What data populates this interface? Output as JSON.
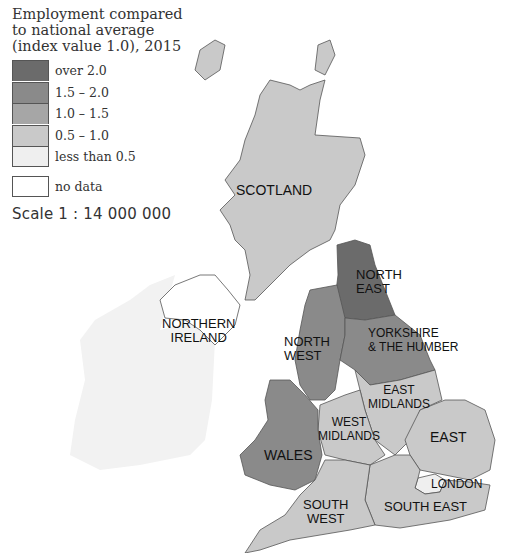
{
  "legend": {
    "title_lines": [
      "Employment compared",
      "to national average",
      "(index value 1.0), 2015"
    ],
    "items": [
      {
        "label": "over 2.0",
        "color": "#6b6b6b"
      },
      {
        "label": "1.5 – 2.0",
        "color": "#8a8a8a"
      },
      {
        "label": "1.0 – 1.5",
        "color": "#a6a6a6"
      },
      {
        "label": "0.5 – 1.0",
        "color": "#c9c9c9"
      },
      {
        "label": "less than 0.5",
        "color": "#efefef"
      }
    ],
    "no_data": {
      "label": "no data",
      "color": "#ffffff"
    },
    "scale": "Scale 1 : 14 000 000"
  },
  "regions": [
    {
      "name": "SCOTLAND",
      "lines": [
        "SCOTLAND"
      ],
      "class": "0.5 – 1.0"
    },
    {
      "name": "NORTH EAST",
      "lines": [
        "NORTH",
        "EAST"
      ],
      "class": "over 2.0"
    },
    {
      "name": "NORTH WEST",
      "lines": [
        "NORTH",
        "WEST"
      ],
      "class": "1.5 – 2.0"
    },
    {
      "name": "YORKSHIRE & THE HUMBER",
      "lines": [
        "YORKSHIRE",
        "& THE HUMBER"
      ],
      "class": "1.5 – 2.0"
    },
    {
      "name": "EAST MIDLANDS",
      "lines": [
        "EAST",
        "MIDLANDS"
      ],
      "class": "0.5 – 1.0"
    },
    {
      "name": "WEST MIDLANDS",
      "lines": [
        "WEST",
        "MIDLANDS"
      ],
      "class": "0.5 – 1.0"
    },
    {
      "name": "WALES",
      "lines": [
        "WALES"
      ],
      "class": "1.5 – 2.0"
    },
    {
      "name": "EAST",
      "lines": [
        "EAST"
      ],
      "class": "0.5 – 1.0"
    },
    {
      "name": "LONDON",
      "lines": [
        "LONDON"
      ],
      "class": "less than 0.5"
    },
    {
      "name": "SOUTH EAST",
      "lines": [
        "SOUTH EAST"
      ],
      "class": "0.5 – 1.0"
    },
    {
      "name": "SOUTH WEST",
      "lines": [
        "SOUTH",
        "WEST"
      ],
      "class": "0.5 – 1.0"
    },
    {
      "name": "NORTHERN IRELAND",
      "lines": [
        "NORTHERN",
        "IRELAND"
      ],
      "class": "no data"
    }
  ]
}
